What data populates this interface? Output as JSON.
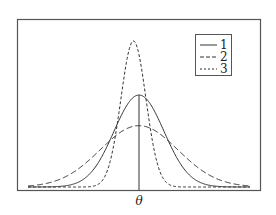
{
  "chart_data": {
    "type": "line",
    "title": "",
    "xlabel": "",
    "ylabel": "",
    "x_tick_labels": [
      "θ"
    ],
    "center": 0,
    "xlim": [
      -4,
      4
    ],
    "grid": false,
    "legend_position": "top-right",
    "vertical_marker_at": 0,
    "series": [
      {
        "name": "1",
        "style": "solid",
        "mean": 0,
        "sd": 0.9,
        "relative_peak": 0.63
      },
      {
        "name": "2",
        "style": "dashed",
        "mean": 0,
        "sd": 1.4,
        "relative_peak": 0.42
      },
      {
        "name": "3",
        "style": "short-dashed",
        "mean": -0.2,
        "sd": 0.45,
        "relative_peak": 1.0
      }
    ]
  }
}
